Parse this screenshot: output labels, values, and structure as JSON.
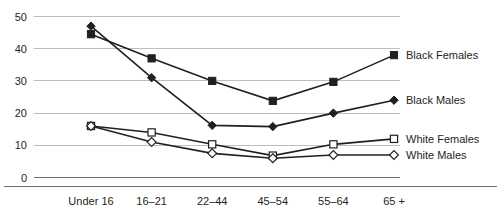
{
  "chart_data": {
    "type": "line",
    "title": "",
    "subtitle": "",
    "xlabel": "",
    "ylabel": "",
    "categories": [
      "Under 16",
      "16–21",
      "22–44",
      "45–54",
      "55–64",
      "65 +"
    ],
    "ylim": [
      0,
      50
    ],
    "yticks": [
      0,
      10,
      20,
      30,
      40,
      50
    ],
    "ytick_labels": [
      "0",
      "10",
      "20",
      "30",
      "40",
      "50"
    ],
    "grid": true,
    "legend_position": "right-inline-at-line-ends",
    "series": [
      {
        "name": "Black Females",
        "marker": "filled-square",
        "color": "#231f20",
        "values": [
          44.5,
          37,
          30,
          23.8,
          29.7,
          38
        ]
      },
      {
        "name": "Black Males",
        "marker": "filled-diamond",
        "color": "#231f20",
        "values": [
          47,
          31,
          16.2,
          15.8,
          20,
          24
        ]
      },
      {
        "name": "White Females",
        "marker": "open-square",
        "color": "#231f20",
        "values": [
          16,
          14,
          10.3,
          6.8,
          10.3,
          12
        ]
      },
      {
        "name": "White Males",
        "marker": "open-diamond",
        "color": "#231f20",
        "values": [
          16,
          11,
          7.5,
          6.0,
          7.0,
          7.0
        ]
      }
    ]
  },
  "legend": {
    "entries": [
      {
        "label": "Black Females"
      },
      {
        "label": "Black Males"
      },
      {
        "label": "White Females"
      },
      {
        "label": "White Males"
      }
    ]
  },
  "axes": {
    "y_labels": [
      "50",
      "40",
      "30",
      "20",
      "10",
      "0"
    ],
    "x_labels": [
      "Under 16",
      "16–21",
      "22–44",
      "45–54",
      "55–64",
      "65 +"
    ]
  },
  "colors": {
    "ink": "#231f20",
    "grid": "#bcbec0",
    "axis": "#6d6e71",
    "background": "#ffffff"
  }
}
